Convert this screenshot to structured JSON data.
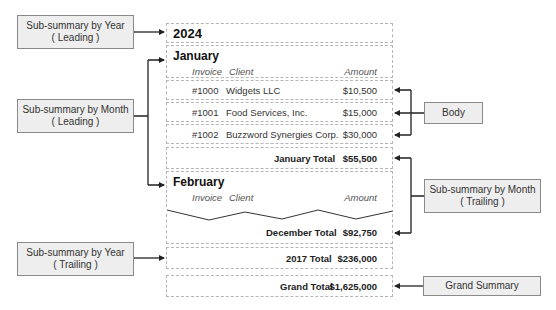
{
  "labels": {
    "year_leading": {
      "line1": "Sub-summary by Year",
      "line2": "( Leading )"
    },
    "month_leading": {
      "line1": "Sub-summary by Month",
      "line2": "( Leading )"
    },
    "year_trailing": {
      "line1": "Sub-summary by Year",
      "line2": "( Trailing )"
    },
    "body": {
      "line1": "Body"
    },
    "month_trailing": {
      "line1": "Sub-summary by Month",
      "line2": "( Trailing )"
    },
    "grand_summary": {
      "line1": "Grand Summary"
    }
  },
  "report": {
    "year": "2024",
    "months": [
      {
        "name": "January",
        "columns": {
          "invoice": "Invoice",
          "client": "Client",
          "amount": "Amount"
        },
        "rows": [
          {
            "invoice": "#1000",
            "client": "Widgets LLC",
            "amount": "$10,500"
          },
          {
            "invoice": "#1001",
            "client": "Food Services, Inc.",
            "amount": "$15,000"
          },
          {
            "invoice": "#1002",
            "client": "Buzzword Synergies Corp.",
            "amount": "$30,000"
          }
        ],
        "total_label": "January Total",
        "total_value": "$55,500"
      },
      {
        "name": "February",
        "columns": {
          "invoice": "Invoice",
          "client": "Client",
          "amount": "Amount"
        }
      }
    ],
    "december_total": {
      "label": "December Total",
      "value": "$92,750"
    },
    "year_total": {
      "label": "2017 Total",
      "value": "$236,000"
    },
    "grand_total": {
      "label": "Grand Total",
      "value": "$1,625,000"
    }
  },
  "colors": {
    "label_fill": "#eeeeee",
    "label_border": "#8a8a8a",
    "arrow": "#222222",
    "dashed_border": "#b5b5b5"
  }
}
